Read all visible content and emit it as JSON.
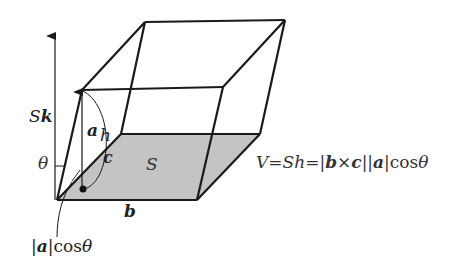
{
  "diagram": {
    "colors": {
      "stroke": "#1a1a1a",
      "base_fill": "#c4c4c4",
      "background": "#ffffff"
    },
    "vertices": {
      "bottom_front_left": [
        57,
        200
      ],
      "bottom_front_right": [
        197,
        200
      ],
      "bottom_back_right": [
        260,
        134
      ],
      "bottom_back_left": [
        121,
        134
      ],
      "top_front_left": [
        82,
        90
      ],
      "top_front_right": [
        223,
        87
      ],
      "top_back_right": [
        285,
        20
      ],
      "top_back_left": [
        145,
        22
      ]
    },
    "labels": {
      "sk_S": "S",
      "sk_k": "k",
      "a": "a",
      "h": "h",
      "c": "c",
      "theta": "θ",
      "S": "S",
      "b": "b",
      "proj_bar_open": "|",
      "proj_a": "a",
      "proj_bar_close": "|",
      "proj_cos": "cos",
      "proj_theta": "θ"
    },
    "formula": {
      "V": "V",
      "eq1": "=",
      "S": "S",
      "h": "h",
      "eq2": "=",
      "bar1": "|",
      "b": "b",
      "cross": "×",
      "c": "c",
      "bar2": "|",
      "bar3": "|",
      "a": "a",
      "bar4": "|",
      "cos": "cos",
      "theta": "θ"
    }
  }
}
